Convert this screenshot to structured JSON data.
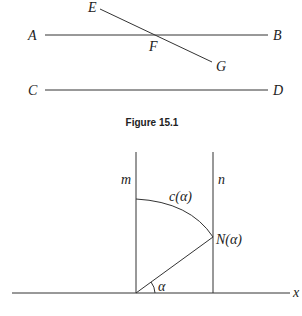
{
  "figure1": {
    "caption": "Figure 15.1",
    "labels": {
      "A": "A",
      "B": "B",
      "C": "C",
      "D": "D",
      "E": "E",
      "F": "F",
      "G": "G"
    }
  },
  "figure2": {
    "labels": {
      "m": "m",
      "n": "n",
      "c_alpha": "c(α)",
      "N_alpha": "N(α)",
      "alpha": "α",
      "x": "x"
    }
  }
}
